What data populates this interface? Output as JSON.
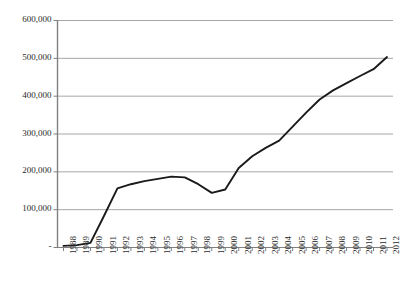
{
  "chart_data": {
    "type": "line",
    "title": "",
    "subtitle": "",
    "xlabel": "",
    "ylabel": "",
    "grid": "horizontal",
    "legend": "none",
    "ylim": [
      0,
      600000
    ],
    "ytick_labels": [
      "600,000",
      "500,000",
      "400,000",
      "300,000",
      "200,000",
      "100,000",
      "-"
    ],
    "ytick_values": [
      600000,
      500000,
      400000,
      300000,
      200000,
      100000,
      0
    ],
    "categories": [
      "1988",
      "1989",
      "1990",
      "1991",
      "1992",
      "1993",
      "1994",
      "1995",
      "1996",
      "1997",
      "1998",
      "1999",
      "2000",
      "2001",
      "2002",
      "2003",
      "2004",
      "2005",
      "2006",
      "2007",
      "2008",
      "2009",
      "2010",
      "2011",
      "2012"
    ],
    "series": [
      {
        "name": "",
        "color": "#1a1a1a",
        "values": [
          3000,
          5000,
          11000,
          82000,
          155000,
          166000,
          174000,
          180000,
          186000,
          184000,
          166000,
          143000,
          152000,
          209000,
          240000,
          262000,
          281000,
          318000,
          355000,
          390000,
          414000,
          433000,
          452000,
          470000,
          502000
        ]
      }
    ]
  },
  "axes": {
    "gridline_color": "#a6a6a6",
    "axis_color": "#808080",
    "tick_color": "#808080"
  }
}
